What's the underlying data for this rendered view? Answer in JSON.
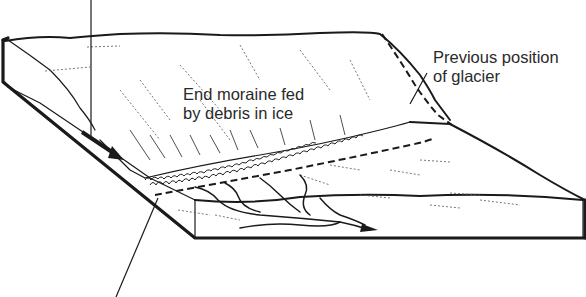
{
  "diagram": {
    "labels": {
      "end_moraine_line1": "End moraine fed",
      "end_moraine_line2": "by debris in ice",
      "previous_position_line1": "Previous position",
      "previous_position_line2": "of glacier"
    },
    "leaders": [
      {
        "name": "top-leader",
        "from": [
          91,
          0
        ],
        "to": [
          91,
          140
        ]
      },
      {
        "name": "bottom-leader",
        "from": [
          158,
          198
        ],
        "to": [
          116,
          297
        ]
      },
      {
        "name": "previous-position-leader",
        "from": [
          427,
          73
        ],
        "to": [
          410,
          104
        ]
      }
    ],
    "colors": {
      "ink": "#1a1a1a",
      "text": "#2a2a2a",
      "background": "#ffffff"
    }
  }
}
